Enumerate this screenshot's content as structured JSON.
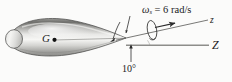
{
  "figure": {
    "name": "spinning-projectile-precession-diagram",
    "background_color": "#fbfbfa"
  },
  "labels": {
    "spin_symbol": "ω",
    "spin_subscript": "s",
    "spin_equation": " = 6 rad/s",
    "spin_full": "ωs = 6 rad/s",
    "spin_value": 6,
    "spin_units": "rad/s",
    "body_axis": "z",
    "reference_axis": "Z",
    "angle": "10°",
    "angle_value": 10,
    "angle_units": "degrees",
    "center_of_mass": "G"
  },
  "geometry": {
    "body_axis_angle_deg": 10,
    "nose_tip": {
      "x": 126,
      "y": 38
    },
    "center_of_mass_point": {
      "x": 54,
      "y": 40
    },
    "reference_axis_start": {
      "x": 126,
      "y": 45
    },
    "reference_axis_end": {
      "x": 209,
      "y": 45
    },
    "body_axis_start": {
      "x": 118,
      "y": 40
    },
    "body_axis_end": {
      "x": 208,
      "y": 20
    }
  },
  "colors": {
    "outline": "#3a3a3a",
    "body_light": "#f2f2f0",
    "body_mid": "#b9b9b6",
    "body_dark": "#6e6e6b",
    "axis": "#8d8d8a",
    "text": "#1a1a1a"
  }
}
